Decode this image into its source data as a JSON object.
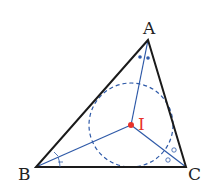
{
  "diagram": {
    "vertices": [
      {
        "name": "A",
        "label": "A"
      },
      {
        "name": "B",
        "label": "B"
      },
      {
        "name": "C",
        "label": "C"
      }
    ],
    "incenter": {
      "name": "I",
      "label": "I"
    },
    "colors": {
      "triangle": "#1a1a1a",
      "bisector": "#2f5aa8",
      "incircle": "#2f5aa8",
      "incenter": "#e8322a",
      "angle_mark_A": "#2f5aa8"
    },
    "angle_marks": {
      "A": "dots",
      "B": "ticks",
      "C": "circles"
    },
    "incircle_style": "dashed"
  }
}
